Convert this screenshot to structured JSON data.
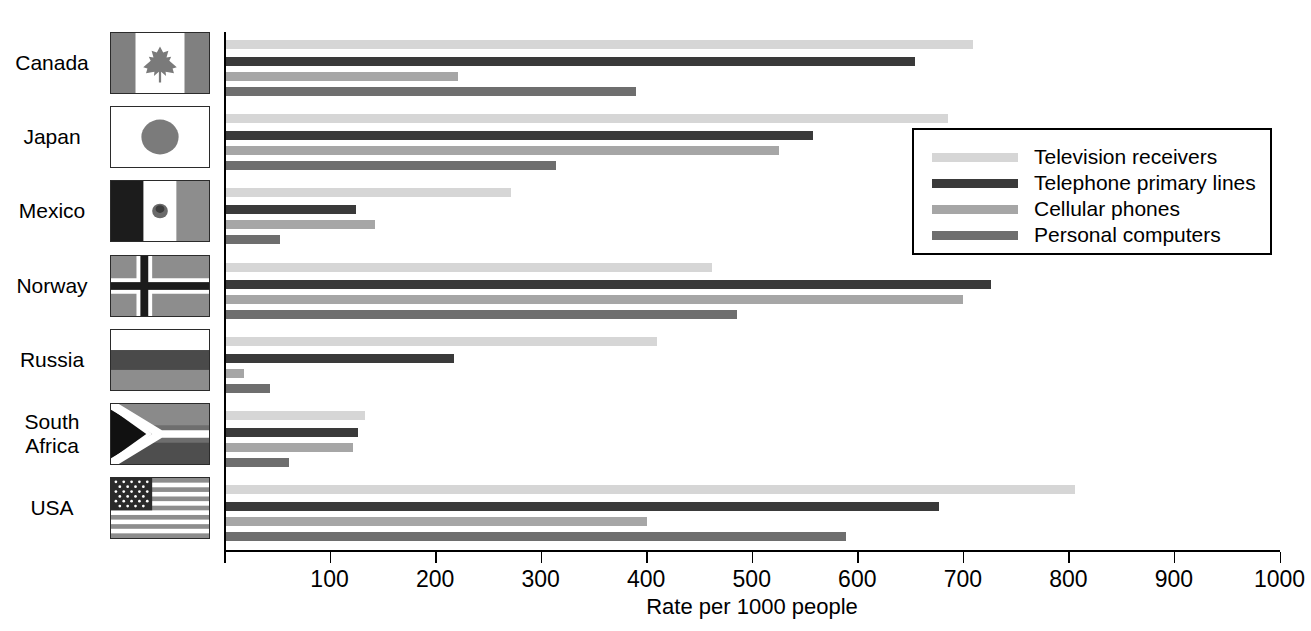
{
  "chart_data": {
    "type": "bar",
    "orientation": "horizontal",
    "title": "",
    "xlabel": "Rate per 1000 people",
    "ylabel": "",
    "xlim": [
      0,
      1000
    ],
    "xticks": [
      0,
      100,
      200,
      300,
      400,
      500,
      600,
      700,
      800,
      900,
      1000
    ],
    "xtick_labels": [
      "",
      "100",
      "200",
      "300",
      "400",
      "500",
      "600",
      "700",
      "800",
      "900",
      "1000"
    ],
    "grid": false,
    "legend_position": "upper right",
    "categories": [
      "Canada",
      "Japan",
      "Mexico",
      "Norway",
      "Russia",
      "South Africa",
      "USA"
    ],
    "series": [
      {
        "name": "Television receivers",
        "color": "#d6d6d6",
        "values": [
          710,
          686,
          272,
          462,
          410,
          134,
          806
        ]
      },
      {
        "name": "Telephone primary lines",
        "color": "#3a3a3a",
        "values": [
          655,
          558,
          125,
          727,
          218,
          127,
          677
        ]
      },
      {
        "name": "Cellular phones",
        "color": "#a6a6a6",
        "values": [
          222,
          526,
          143,
          700,
          19,
          122,
          401
        ]
      },
      {
        "name": "Personal computers",
        "color": "#6e6e6e",
        "values": [
          390,
          315,
          53,
          486,
          44,
          62,
          589
        ]
      }
    ]
  },
  "axis": {
    "x_title": "Rate per 1000 people",
    "tick_labels": [
      "100",
      "200",
      "300",
      "400",
      "500",
      "600",
      "700",
      "800",
      "900",
      "1000"
    ]
  },
  "legend": {
    "items": [
      {
        "label": "Television receivers",
        "color": "#d6d6d6",
        "icon": "legend-line-swatch"
      },
      {
        "label": "Telephone primary lines",
        "color": "#3a3a3a",
        "icon": "legend-line-swatch"
      },
      {
        "label": "Cellular phones",
        "color": "#a6a6a6",
        "icon": "legend-line-swatch"
      },
      {
        "label": "Personal computers",
        "color": "#6e6e6e",
        "icon": "legend-line-swatch"
      }
    ]
  },
  "countries": [
    {
      "name": "Canada",
      "flag_icon": "flag-canada-icon"
    },
    {
      "name": "Japan",
      "flag_icon": "flag-japan-icon"
    },
    {
      "name": "Mexico",
      "flag_icon": "flag-mexico-icon"
    },
    {
      "name": "Norway",
      "flag_icon": "flag-norway-icon"
    },
    {
      "name": "Russia",
      "flag_icon": "flag-russia-icon"
    },
    {
      "name": "South Africa",
      "flag_icon": "flag-south-africa-icon"
    },
    {
      "name": "USA",
      "flag_icon": "flag-usa-icon"
    }
  ]
}
